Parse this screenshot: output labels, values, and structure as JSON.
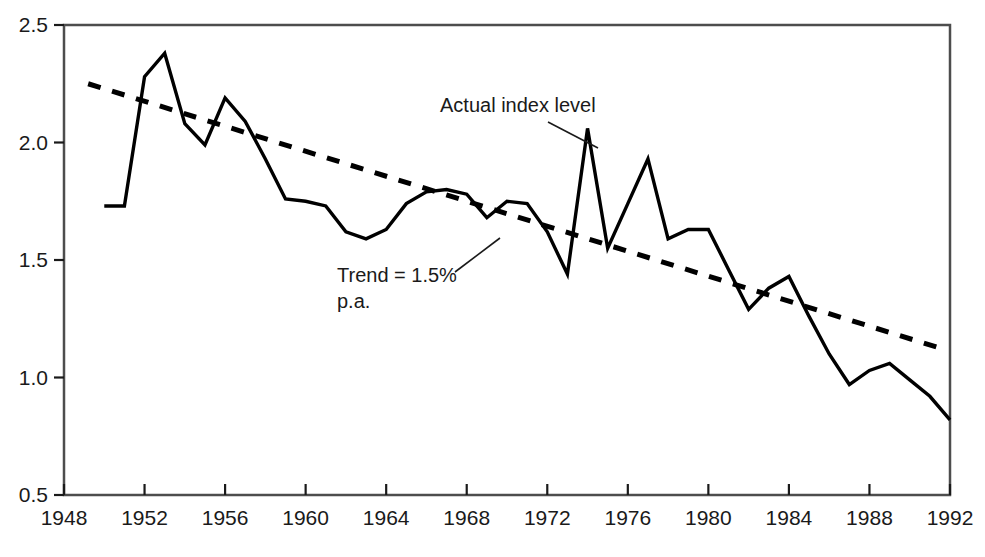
{
  "chart_data": {
    "type": "line",
    "title": "",
    "xlabel": "",
    "ylabel": "",
    "xlim": [
      1948,
      1992
    ],
    "ylim": [
      0.5,
      2.5
    ],
    "grid": false,
    "legend_position": "inline-annotations",
    "x_ticks": [
      "1948",
      "1952",
      "1956",
      "1960",
      "1964",
      "1968",
      "1972",
      "1976",
      "1980",
      "1984",
      "1988",
      "1992"
    ],
    "y_ticks": [
      "0.5",
      "1.0",
      "1.5",
      "2.0",
      "2.5"
    ],
    "annotations": [
      {
        "id": "actual-index-level",
        "text": "Actual index level",
        "lines": [
          "Actual index level"
        ]
      },
      {
        "id": "trend-label",
        "text": "Trend = 1.5% p.a.",
        "lines": [
          "Trend = 1.5%",
          "p.a."
        ]
      }
    ],
    "series": [
      {
        "name": "Actual index level",
        "style": "solid",
        "color": "#000000",
        "x": [
          1950,
          1951,
          1952,
          1953,
          1954,
          1955,
          1956,
          1957,
          1958,
          1959,
          1960,
          1961,
          1962,
          1963,
          1964,
          1965,
          1966,
          1967,
          1968,
          1969,
          1970,
          1971,
          1972,
          1973,
          1974,
          1975,
          1976,
          1977,
          1978,
          1979,
          1980,
          1981,
          1982,
          1983,
          1984,
          1985,
          1986,
          1987,
          1988,
          1989,
          1990,
          1991,
          1992
        ],
        "values": [
          1.73,
          1.73,
          2.28,
          2.38,
          2.08,
          1.99,
          2.19,
          2.09,
          1.93,
          1.76,
          1.75,
          1.73,
          1.62,
          1.59,
          1.63,
          1.74,
          1.79,
          1.8,
          1.78,
          1.68,
          1.75,
          1.74,
          1.62,
          1.44,
          2.06,
          1.55,
          1.74,
          1.93,
          1.59,
          1.63,
          1.63,
          1.46,
          1.29,
          1.38,
          1.43,
          1.26,
          1.1,
          0.97,
          1.03,
          1.06,
          0.99,
          0.92,
          0.82
        ]
      },
      {
        "name": "Trend = 1.5% p.a.",
        "style": "dashed",
        "color": "#000000",
        "x": [
          1949.2,
          1991.7
        ],
        "values": [
          2.25,
          1.12
        ]
      }
    ]
  },
  "frame": {
    "border_color": "#4d4d4d",
    "background": "#ffffff"
  }
}
